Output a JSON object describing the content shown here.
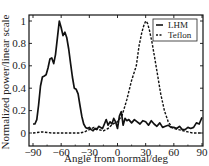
{
  "chart_data": {
    "type": "line",
    "title": "",
    "xlabel": "Angle from normal/deg",
    "ylabel": "Normalized power/linear scale",
    "xlim": [
      -90,
      90
    ],
    "ylim": [
      0,
      1
    ],
    "xticks": [
      -90,
      -60,
      -30,
      0,
      30,
      60,
      90
    ],
    "xtick_labels": [
      "−90",
      "−60",
      "−30",
      "0",
      "30",
      "60",
      "90"
    ],
    "yticks": [
      0,
      0.2,
      0.4,
      0.6,
      0.8,
      1
    ],
    "ytick_labels": [
      "0",
      "0.2",
      "0.4",
      "0.6",
      "0.8",
      "1"
    ],
    "grid": false,
    "legend_position": "upper right",
    "series": [
      {
        "name": "LHM",
        "style": "solid",
        "x": [
          -90,
          -88,
          -86,
          -84,
          -82,
          -80,
          -78,
          -76,
          -74,
          -72,
          -70,
          -68,
          -66,
          -64,
          -62,
          -60,
          -58,
          -56,
          -54,
          -52,
          -50,
          -48,
          -46,
          -44,
          -42,
          -40,
          -38,
          -36,
          -34,
          -32,
          -30,
          -28,
          -26,
          -24,
          -22,
          -20,
          -18,
          -16,
          -14,
          -12,
          -10,
          -8,
          -6,
          -4,
          -2,
          0,
          2,
          4,
          6,
          8,
          10,
          12,
          15,
          18,
          21,
          24,
          27,
          30,
          33,
          36,
          39,
          42,
          45,
          48,
          51,
          54,
          57,
          60,
          63,
          66,
          69,
          72,
          75,
          78,
          81,
          84,
          87,
          90
        ],
        "values": [
          0.08,
          0.08,
          0.12,
          0.25,
          0.42,
          0.5,
          0.51,
          0.52,
          0.58,
          0.66,
          0.67,
          0.62,
          0.7,
          0.85,
          1.0,
          0.94,
          0.87,
          0.9,
          0.85,
          0.75,
          0.62,
          0.5,
          0.4,
          0.39,
          0.35,
          0.25,
          0.15,
          0.08,
          0.05,
          0.04,
          0.05,
          0.03,
          0.02,
          0.04,
          0.03,
          0.06,
          0.05,
          0.04,
          0.08,
          0.12,
          0.07,
          0.1,
          0.08,
          0.13,
          0.1,
          0.04,
          0.15,
          0.19,
          0.07,
          0.13,
          0.11,
          0.12,
          0.09,
          0.12,
          0.1,
          0.08,
          0.11,
          0.1,
          0.07,
          0.11,
          0.08,
          0.06,
          0.09,
          0.05,
          0.06,
          0.07,
          0.05,
          0.05,
          0.04,
          0.06,
          0.03,
          0.03,
          0.05,
          0.04,
          0.05,
          0.09,
          0.08,
          0.14
        ]
      },
      {
        "name": "Teflon",
        "style": "dashed",
        "x": [
          -90,
          -80,
          -70,
          -60,
          -50,
          -40,
          -35,
          -30,
          -25,
          -20,
          -15,
          -10,
          -5,
          0,
          5,
          10,
          15,
          20,
          23,
          26,
          28,
          30,
          32,
          34,
          37,
          40,
          43,
          46,
          50,
          54,
          58,
          60,
          65,
          70,
          75,
          80,
          85,
          90
        ],
        "values": [
          0.0,
          0.01,
          0.0,
          0.0,
          0.0,
          0.0,
          0.01,
          0.03,
          0.05,
          0.03,
          0.02,
          0.04,
          0.08,
          0.1,
          0.16,
          0.3,
          0.47,
          0.6,
          0.78,
          0.9,
          0.96,
          1.0,
          0.98,
          0.92,
          0.8,
          0.65,
          0.5,
          0.35,
          0.2,
          0.1,
          0.05,
          0.04,
          0.03,
          0.02,
          0.01,
          0.0,
          0.0,
          0.0
        ]
      }
    ]
  },
  "legend": {
    "items": [
      {
        "label": "LHM",
        "style": "solid"
      },
      {
        "label": "Teflon",
        "style": "dashed"
      }
    ]
  }
}
